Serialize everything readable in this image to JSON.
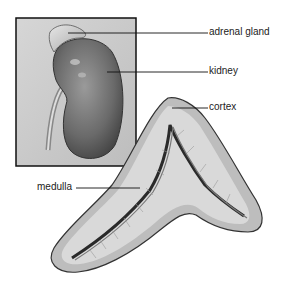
{
  "diagram": {
    "inset": {
      "description": "kidney with adrenal gland on top"
    },
    "labels": [
      {
        "id": "adrenal-gland",
        "text": "adrenal gland"
      },
      {
        "id": "kidney",
        "text": "kidney"
      },
      {
        "id": "cortex",
        "text": "cortex"
      },
      {
        "id": "medulla",
        "text": "medulla"
      }
    ]
  }
}
